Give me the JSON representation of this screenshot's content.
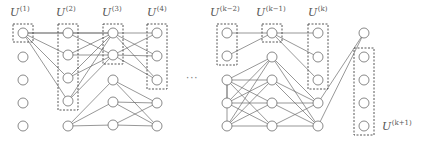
{
  "diagram": {
    "title": "",
    "labels": [
      {
        "id": "U1",
        "base": "U",
        "sup": "(1)",
        "x": 10,
        "y": 5
      },
      {
        "id": "U2",
        "base": "U",
        "sup": "(2)",
        "x": 56,
        "y": 5
      },
      {
        "id": "U3",
        "base": "U",
        "sup": "(3)",
        "x": 102,
        "y": 5
      },
      {
        "id": "U4",
        "base": "U",
        "sup": "(4)",
        "x": 147,
        "y": 5
      },
      {
        "id": "Uk-2",
        "base": "U",
        "sup": "(k−2)",
        "x": 210,
        "y": 5
      },
      {
        "id": "Uk-1",
        "base": "U",
        "sup": "(k−1)",
        "x": 256,
        "y": 5
      },
      {
        "id": "Uk",
        "base": "U",
        "sup": "(k)",
        "x": 307,
        "y": 5
      },
      {
        "id": "Uk+1",
        "base": "U",
        "sup": "(k+1)",
        "x": 382,
        "y": 118
      }
    ],
    "ellipsis": "···",
    "columns": [
      {
        "id": "c1",
        "x": 23,
        "rows": [
          33,
          57,
          80,
          103,
          126
        ]
      },
      {
        "id": "c2",
        "x": 68,
        "rows": [
          33,
          55,
          78,
          101,
          126
        ]
      },
      {
        "id": "c3",
        "x": 113,
        "rows": [
          33,
          55,
          80,
          102,
          125
        ]
      },
      {
        "id": "c4",
        "x": 157,
        "rows": [
          33,
          56,
          80,
          103,
          126
        ]
      },
      {
        "id": "ck2",
        "x": 227,
        "rows": [
          33,
          56,
          80,
          103,
          126
        ]
      },
      {
        "id": "ck1",
        "x": 272,
        "rows": [
          33,
          57,
          80,
          103,
          126
        ]
      },
      {
        "id": "ck",
        "x": 318,
        "rows": [
          33,
          57,
          80,
          103,
          126
        ]
      },
      {
        "id": "cf",
        "x": 364,
        "rows": [
          33,
          57,
          80,
          103,
          126
        ]
      }
    ],
    "boxes": [
      {
        "col": "c1",
        "from": 0,
        "to": 0
      },
      {
        "col": "c2",
        "from": 0,
        "to": 3
      },
      {
        "col": "c3",
        "from": 0,
        "to": 1
      },
      {
        "col": "c4",
        "from": 0,
        "to": 2
      },
      {
        "col": "ck2",
        "from": 0,
        "to": 1
      },
      {
        "col": "ck1",
        "from": 0,
        "to": 0
      },
      {
        "col": "ck",
        "from": 0,
        "to": 2
      },
      {
        "col": "cf",
        "from": 1,
        "to": 4
      }
    ],
    "edges": [
      [
        "c1",
        0,
        "c2",
        0
      ],
      [
        "c1",
        0,
        "c2",
        1
      ],
      [
        "c1",
        0,
        "c2",
        2
      ],
      [
        "c1",
        0,
        "c2",
        3
      ],
      [
        "c1",
        0,
        "c3",
        0
      ],
      [
        "c2",
        0,
        "c3",
        0
      ],
      [
        "c2",
        0,
        "c3",
        1
      ],
      [
        "c2",
        1,
        "c3",
        0
      ],
      [
        "c2",
        1,
        "c3",
        1
      ],
      [
        "c2",
        2,
        "c3",
        0
      ],
      [
        "c2",
        2,
        "c3",
        1
      ],
      [
        "c2",
        3,
        "c3",
        0
      ],
      [
        "c2",
        3,
        "c3",
        1
      ],
      [
        "c2",
        4,
        "c3",
        2
      ],
      [
        "c2",
        4,
        "c3",
        3
      ],
      [
        "c2",
        4,
        "c3",
        4
      ],
      [
        "c3",
        0,
        "c4",
        0
      ],
      [
        "c3",
        0,
        "c4",
        1
      ],
      [
        "c3",
        0,
        "c4",
        2
      ],
      [
        "c3",
        1,
        "c4",
        0
      ],
      [
        "c3",
        1,
        "c4",
        1
      ],
      [
        "c3",
        1,
        "c4",
        2
      ],
      [
        "c3",
        2,
        "c4",
        3
      ],
      [
        "c3",
        2,
        "c4",
        4
      ],
      [
        "c3",
        3,
        "c4",
        3
      ],
      [
        "c3",
        3,
        "c4",
        4
      ],
      [
        "c3",
        4,
        "c4",
        3
      ],
      [
        "c3",
        4,
        "c4",
        4
      ],
      [
        "ck2",
        0,
        "ck1",
        0
      ],
      [
        "ck2",
        1,
        "ck1",
        0
      ],
      [
        "ck2",
        2,
        "ck1",
        1
      ],
      [
        "ck2",
        2,
        "ck1",
        2
      ],
      [
        "ck2",
        2,
        "ck1",
        3
      ],
      [
        "ck2",
        2,
        "ck1",
        4
      ],
      [
        "ck2",
        3,
        "ck1",
        1
      ],
      [
        "ck2",
        3,
        "ck1",
        2
      ],
      [
        "ck2",
        3,
        "ck1",
        3
      ],
      [
        "ck2",
        3,
        "ck1",
        4
      ],
      [
        "ck2",
        4,
        "ck1",
        1
      ],
      [
        "ck2",
        4,
        "ck1",
        2
      ],
      [
        "ck2",
        4,
        "ck1",
        3
      ],
      [
        "ck2",
        4,
        "ck1",
        4
      ],
      [
        "ck2",
        2,
        "ck2",
        3
      ],
      [
        "ck2",
        2,
        "ck2",
        4
      ],
      [
        "ck1",
        0,
        "ck",
        0
      ],
      [
        "ck1",
        0,
        "ck",
        1
      ],
      [
        "ck1",
        0,
        "ck",
        2
      ],
      [
        "ck1",
        1,
        "ck",
        3
      ],
      [
        "ck1",
        1,
        "ck",
        4
      ],
      [
        "ck1",
        2,
        "ck",
        3
      ],
      [
        "ck1",
        2,
        "ck",
        4
      ],
      [
        "ck1",
        3,
        "ck",
        3
      ],
      [
        "ck1",
        3,
        "ck",
        4
      ],
      [
        "ck1",
        4,
        "ck",
        3
      ],
      [
        "ck1",
        4,
        "ck",
        4
      ],
      [
        "ck",
        3,
        "cf",
        0
      ],
      [
        "ck",
        4,
        "cf",
        0
      ]
    ],
    "colors": {
      "stroke": "#6b6b6b",
      "node_fill": "#ffffff",
      "box": "#444444",
      "text": "#555555"
    }
  }
}
